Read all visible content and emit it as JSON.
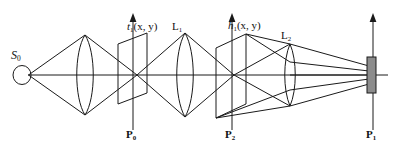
{
  "figure": {
    "type": "optical-system-diagram",
    "title": "",
    "background_color": "#ffffff",
    "line_color": "#1a1a1a",
    "detector_fill": "#8c8c8c"
  },
  "labels": {
    "source": {
      "base": "S",
      "sub": "0",
      "name": "point-source-label"
    },
    "transparency": {
      "base": "t",
      "sub": "1",
      "args": "(x,  y)",
      "name": "transparency-function-label"
    },
    "lens1": {
      "base": "L",
      "sub": "1",
      "name": "lens-one-label"
    },
    "impulse": {
      "base": "h",
      "sub": "1",
      "args": "(x,  y)",
      "name": "impulse-response-label"
    },
    "lens2": {
      "base": "L",
      "sub": "2",
      "name": "lens-two-label"
    },
    "plane0": {
      "base": "P",
      "sub": "0",
      "name": "object-plane-label"
    },
    "plane2": {
      "base": "P",
      "sub": "2",
      "name": "filter-plane-label"
    },
    "plane1": {
      "base": "P",
      "sub": "1",
      "name": "image-plane-label"
    }
  },
  "elements": {
    "source_label": "S0",
    "condenser_lens": "biconvex-lens",
    "object_plane": "tilted-parallelogram-plane",
    "lens_one": "biconvex-lens",
    "filter_plane": "tilted-parallelogram-plane",
    "lens_two": "thin-biconvex-lens",
    "image_plane": "detector-bar",
    "optical_axis": "horizontal-axis-line"
  },
  "axes": {
    "optical_axis_y": 75,
    "arrow_tops": [
      14,
      14,
      14
    ]
  }
}
